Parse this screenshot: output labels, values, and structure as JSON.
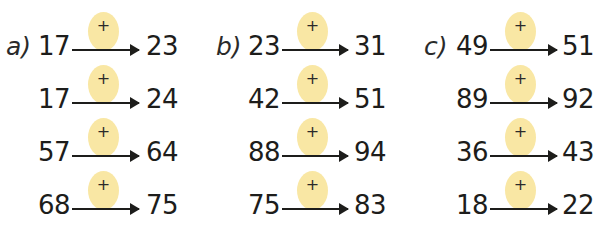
{
  "exercise": {
    "operation_symbol": "+",
    "columns": [
      {
        "label": "a)",
        "rows": [
          {
            "start": "17",
            "end": "23"
          },
          {
            "start": "17",
            "end": "24"
          },
          {
            "start": "57",
            "end": "64"
          },
          {
            "start": "68",
            "end": "75"
          }
        ]
      },
      {
        "label": "b)",
        "rows": [
          {
            "start": "23",
            "end": "31"
          },
          {
            "start": "42",
            "end": "51"
          },
          {
            "start": "88",
            "end": "94"
          },
          {
            "start": "75",
            "end": "83"
          }
        ]
      },
      {
        "label": "c)",
        "rows": [
          {
            "start": "49",
            "end": "51"
          },
          {
            "start": "89",
            "end": "92"
          },
          {
            "start": "36",
            "end": "43"
          },
          {
            "start": "18",
            "end": "22"
          }
        ]
      }
    ],
    "colors": {
      "bubble": "#f9e7a4",
      "ink": "#1d1d1b"
    }
  }
}
